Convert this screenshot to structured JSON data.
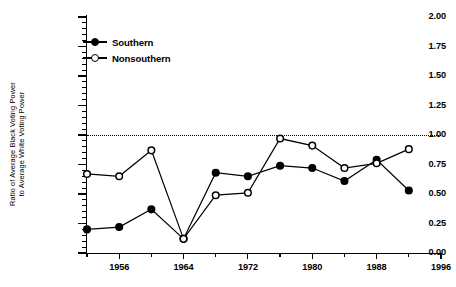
{
  "chart_data": {
    "type": "line",
    "title": "",
    "xlabel": "",
    "ylabel": "Ratio of Average Black Voting Power to Average White Voting Power",
    "ylabel_lines": [
      "Ratio of  Average Black Voting Power",
      "to Average White Voting Power"
    ],
    "x": [
      1952,
      1956,
      1960,
      1964,
      1968,
      1972,
      1976,
      1980,
      1984,
      1988,
      1992
    ],
    "xlim": [
      1952,
      1996
    ],
    "ylim": [
      0.0,
      2.0
    ],
    "ytick_step": 0.25,
    "yticks": [
      0.0,
      0.25,
      0.5,
      0.75,
      1.0,
      1.25,
      1.5,
      1.75,
      2.0
    ],
    "ytick_labels": [
      "0.00",
      "0.25",
      "0.50",
      "0.75",
      "1.00",
      "1.25",
      "1.50",
      "1.75",
      "2.00"
    ],
    "xticks_major": [
      1956,
      1964,
      1972,
      1980,
      1988,
      1996
    ],
    "xtick_labels": [
      "1956",
      "1964",
      "1972",
      "1980",
      "1988",
      "1996"
    ],
    "xticks_minor": [
      1952,
      1960,
      1968,
      1976,
      1984,
      1992
    ],
    "grid": false,
    "legend_position": "upper-left",
    "reference_line": {
      "value": 1.0,
      "style": "dotted"
    },
    "series": [
      {
        "name": "Southern",
        "marker": "filled-circle",
        "values": [
          0.2,
          0.22,
          0.37,
          0.12,
          0.68,
          0.65,
          0.74,
          0.72,
          0.61,
          0.79,
          0.53
        ]
      },
      {
        "name": "Nonsouthern",
        "marker": "open-circle",
        "values": [
          0.67,
          0.65,
          0.87,
          0.12,
          0.49,
          0.51,
          0.97,
          0.91,
          0.72,
          0.76,
          0.88
        ]
      }
    ]
  },
  "legend": {
    "items": [
      {
        "label": "Southern",
        "marker": "filled-circle"
      },
      {
        "label": "Nonsouthern",
        "marker": "open-circle"
      }
    ]
  }
}
